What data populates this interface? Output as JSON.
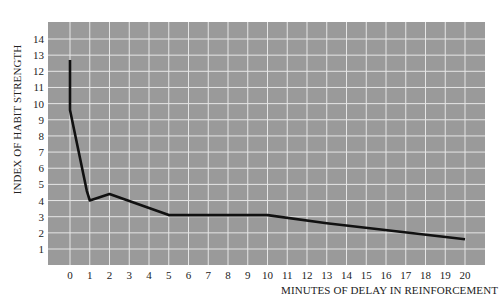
{
  "chart_data": {
    "type": "line",
    "title": "",
    "xlabel": "MINUTES OF DELAY IN REINFORCEMENT",
    "ylabel": "INDEX OF HABIT STRENGTH",
    "x_ticks": [
      0,
      1,
      2,
      3,
      4,
      5,
      6,
      7,
      8,
      9,
      10,
      11,
      12,
      13,
      14,
      15,
      16,
      17,
      18,
      19,
      20
    ],
    "y_ticks": [
      1,
      2,
      3,
      4,
      5,
      6,
      7,
      8,
      9,
      10,
      11,
      12,
      13,
      14
    ],
    "xlim": [
      -1.1,
      21.3
    ],
    "ylim": [
      0.3,
      14.7
    ],
    "grid": true,
    "legend": null,
    "series": [
      {
        "name": "Habit strength",
        "x": [
          0,
          0,
          0.85,
          1,
          2,
          5,
          10,
          13,
          20
        ],
        "y": [
          12.7,
          9.6,
          4.6,
          4.0,
          4.4,
          3.1,
          3.1,
          2.6,
          1.6
        ]
      }
    ],
    "colors": {
      "plot_background": "#9a9a9a",
      "grid": "#e6e6e6",
      "line": "#111111"
    }
  }
}
